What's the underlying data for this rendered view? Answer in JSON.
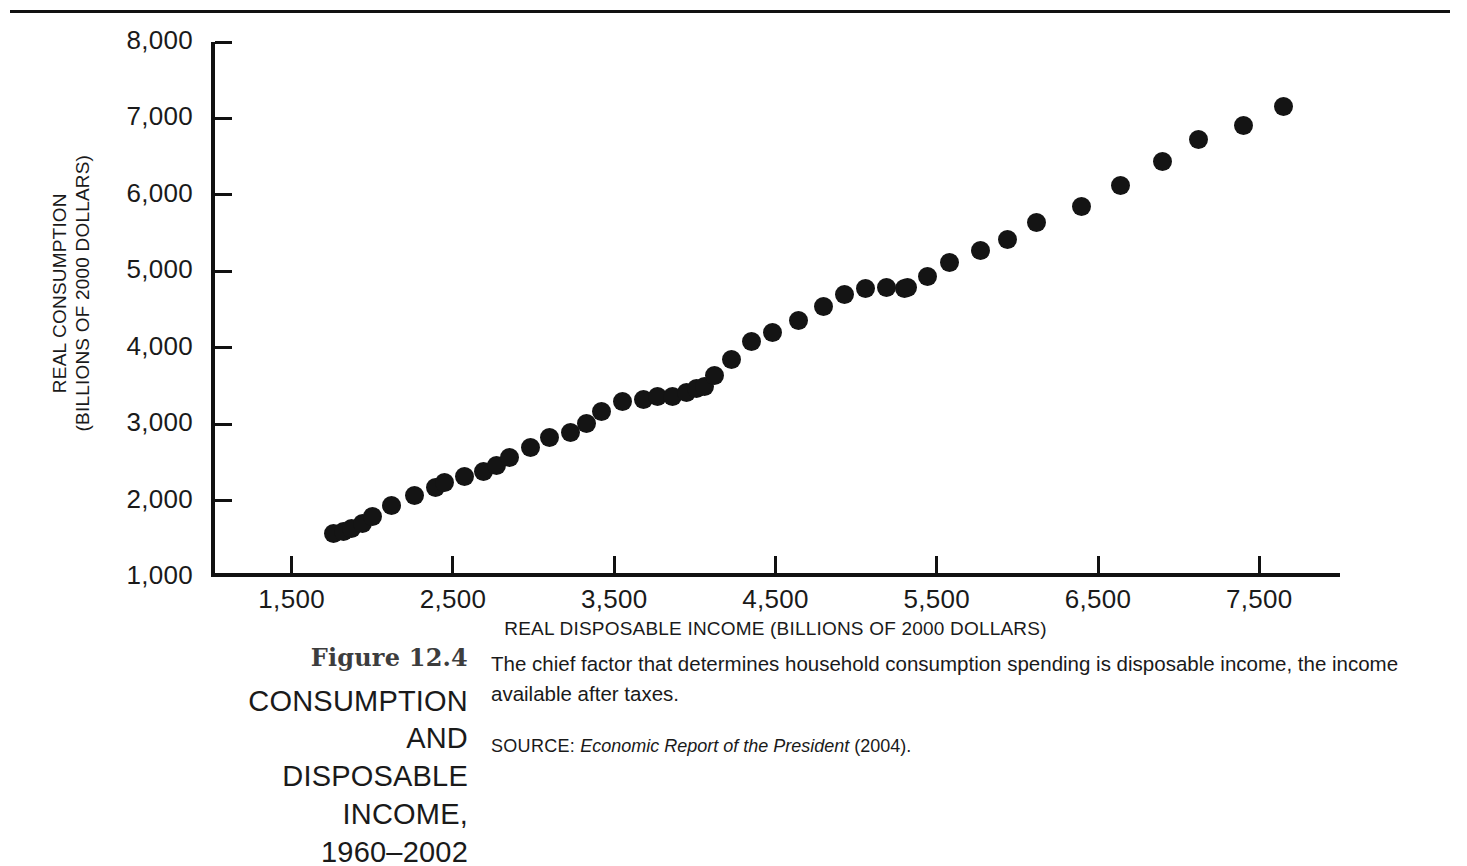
{
  "figure": {
    "number": "Figure 12.4",
    "name": "CONSUMPTION AND\nDISPOSABLE INCOME,\n1960–2002",
    "caption": "The chief factor that determines household consumption spending is disposable income, the income available after taxes.",
    "source_label": "SOURCE:",
    "source_title": "Economic Report of the President",
    "source_year": "(2004)."
  },
  "chart_data": {
    "type": "scatter",
    "title": "CONSUMPTION AND DISPOSABLE INCOME, 1960–2002",
    "xlabel": "REAL DISPOSABLE INCOME (BILLIONS OF 2000 DOLLARS)",
    "ylabel": "REAL CONSUMPTION\n(BILLIONS OF 2000 DOLLARS)",
    "xlim": [
      1000,
      8000
    ],
    "ylim": [
      1000,
      8000
    ],
    "xticks": [
      1500,
      2500,
      3500,
      4500,
      5500,
      6500,
      7500
    ],
    "xtick_labels": [
      "1,500",
      "2,500",
      "3,500",
      "4,500",
      "5,500",
      "6,500",
      "7,500"
    ],
    "yticks": [
      1000,
      2000,
      3000,
      4000,
      5000,
      6000,
      7000,
      8000
    ],
    "ytick_labels": [
      "1,000",
      "2,000",
      "3,000",
      "4,000",
      "5,000",
      "6,000",
      "7,000",
      "8,000"
    ],
    "grid": false,
    "legend": null,
    "marker": "filled-circle",
    "marker_color": "#141414",
    "series": [
      {
        "name": "Consumption vs. disposable income, 1960–2002",
        "x": [
          1760,
          1820,
          1870,
          1940,
          2000,
          2120,
          2260,
          2390,
          2450,
          2570,
          2690,
          2770,
          2850,
          2980,
          3100,
          3230,
          3330,
          3420,
          3550,
          3680,
          3770,
          3860,
          3950,
          4010,
          4060,
          4120,
          4230,
          4350,
          4480,
          4640,
          4800,
          4930,
          5060,
          5190,
          5300,
          5320,
          5440,
          5580,
          5770,
          5940,
          6120,
          6400,
          6640,
          6900,
          7120,
          7400,
          7650
        ],
        "y": [
          1570,
          1600,
          1640,
          1700,
          1790,
          1930,
          2060,
          2170,
          2230,
          2320,
          2380,
          2460,
          2560,
          2700,
          2830,
          2890,
          3010,
          3160,
          3290,
          3320,
          3360,
          3360,
          3420,
          3460,
          3490,
          3640,
          3850,
          4080,
          4200,
          4350,
          4540,
          4700,
          4770,
          4790,
          4780,
          4790,
          4930,
          5120,
          5270,
          5420,
          5640,
          5850,
          6120,
          6430,
          6730,
          6910,
          7160
        ]
      }
    ],
    "n_points": 47,
    "first_year": 1960,
    "last_year": 2002
  }
}
